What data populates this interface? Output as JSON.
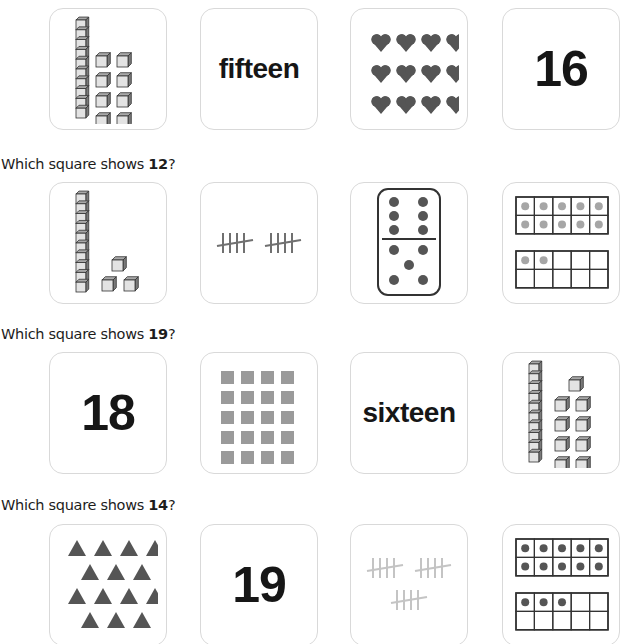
{
  "questions": [
    {
      "prompt_prefix": "",
      "number": "",
      "prompt_suffix": "",
      "label_visible": false,
      "options": [
        {
          "type": "base-ten-blocks",
          "tens": 1,
          "ones": 8,
          "description": "one ten-rod and 8 unit cubes"
        },
        {
          "type": "word",
          "text": "fifteen"
        },
        {
          "type": "hearts",
          "count": 12,
          "rows": 3,
          "cols": 4
        },
        {
          "type": "numeral",
          "text": "16"
        }
      ]
    },
    {
      "prompt_prefix": "Which square shows ",
      "number": "12",
      "prompt_suffix": "?",
      "options": [
        {
          "type": "base-ten-blocks",
          "tens": 1,
          "ones": 3,
          "description": "one ten-rod and 3 unit cubes"
        },
        {
          "type": "tally",
          "count": 10,
          "groups": [
            5,
            5
          ]
        },
        {
          "type": "domino",
          "top": 6,
          "bottom": 5
        },
        {
          "type": "ten-frames",
          "count": 12
        }
      ]
    },
    {
      "prompt_prefix": "Which square shows ",
      "number": "19",
      "prompt_suffix": "?",
      "options": [
        {
          "type": "numeral",
          "text": "18"
        },
        {
          "type": "squares",
          "count": 20,
          "rows": 5,
          "cols": 4
        },
        {
          "type": "word",
          "text": "sixteen"
        },
        {
          "type": "base-ten-blocks",
          "tens": 1,
          "ones": 9,
          "description": "one ten-rod and 9 unit cubes"
        }
      ]
    },
    {
      "prompt_prefix": "Which square shows ",
      "number": "14",
      "prompt_suffix": "?",
      "options": [
        {
          "type": "triangles",
          "count": 14,
          "rows": [
            4,
            3,
            4,
            3
          ]
        },
        {
          "type": "numeral",
          "text": "19"
        },
        {
          "type": "tally",
          "count": 15,
          "groups": [
            5,
            5,
            5
          ]
        },
        {
          "type": "ten-frames",
          "count": 13
        }
      ]
    }
  ],
  "colors": {
    "card_border": "#d9d9d9",
    "shape_fill": "#555555",
    "cube_face": "#e3e3e3",
    "cube_top": "#a8a8a8",
    "cube_side": "#7a7a7a",
    "light_dot": "#a6a6a6",
    "square_fill": "#9a9a9a",
    "tally_dark": "#707070",
    "tally_light": "#c4c4c4"
  }
}
